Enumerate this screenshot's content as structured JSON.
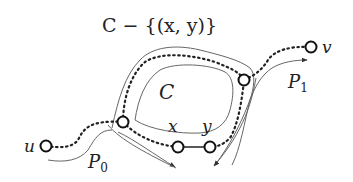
{
  "diagram": {
    "title_label": "C − {(x, y)}",
    "cycle_label": "C",
    "nodes": {
      "u": {
        "label": "u",
        "x": 46,
        "y": 146
      },
      "a": {
        "label": "",
        "x": 123,
        "y": 122
      },
      "b": {
        "label": "",
        "x": 244,
        "y": 80
      },
      "x": {
        "label": "x",
        "x": 178,
        "y": 147
      },
      "y": {
        "label": "y",
        "x": 210,
        "y": 147
      },
      "v": {
        "label": "v",
        "x": 311,
        "y": 47
      }
    },
    "paths": {
      "p0": {
        "label": "P",
        "subscript": "0"
      },
      "p1": {
        "label": "P",
        "subscript": "1"
      }
    },
    "edge_xy": "solid edge (x,y) removed from cycle C",
    "colors": {
      "stroke": "#222222",
      "thin_stroke": "#555555",
      "background": "#ffffff"
    }
  }
}
